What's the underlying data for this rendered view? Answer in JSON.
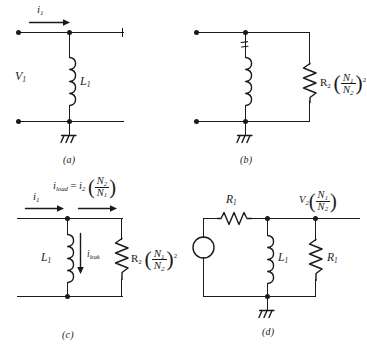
{
  "figure": {
    "type": "circuit-diagram-figure",
    "background": "#ffffff",
    "ink_color": "#1a1a1a",
    "panel_count": 4
  },
  "panels": [
    {
      "id": "a",
      "caption": "(a)",
      "labels": {
        "current_in": "i",
        "current_in_sub": "1",
        "voltage": "V",
        "voltage_sub": "1",
        "inductor": "L",
        "inductor_sub": "1"
      },
      "components": [
        "terminal-left-top",
        "terminal-left-bottom",
        "open-terminal-right",
        "inductor-L1",
        "ground"
      ]
    },
    {
      "id": "b",
      "caption": "(b)",
      "labels": {
        "resistor": "R",
        "resistor_sub": "2",
        "ratio_num": "N",
        "ratio_num_sub": "1",
        "ratio_den": "N",
        "ratio_den_sub": "2",
        "exponent": "2"
      },
      "components": [
        "terminal-left-top",
        "terminal-left-bottom",
        "inductor-L1",
        "resistor-R2-reflected",
        "ground"
      ]
    },
    {
      "id": "c",
      "caption": "(c)",
      "labels": {
        "current_in": "i",
        "current_in_sub": "1",
        "load_current": "i",
        "load_current_sub": "load",
        "equals": "=",
        "source_current": "i",
        "source_current_sub": "2",
        "turns_num": "N",
        "turns_num_sub": "2",
        "turns_den": "N",
        "turns_den_sub": "1",
        "leak_current": "i",
        "leak_current_sub": "leak",
        "inductor": "L",
        "inductor_sub": "1",
        "resistor": "R",
        "resistor_sub": "2",
        "ratio_num": "N",
        "ratio_num_sub": "1",
        "ratio_den": "N",
        "ratio_den_sub": "2",
        "exponent": "2"
      },
      "components": [
        "inductor-L1",
        "resistor-R2-reflected",
        "current-arrow-i1",
        "current-arrow-iload",
        "current-arrow-ileak"
      ]
    },
    {
      "id": "d",
      "caption": "(d)",
      "labels": {
        "series_resistor": "R",
        "series_resistor_sub": "1",
        "output_voltage": "V",
        "output_voltage_sub": "2",
        "ratio_num": "N",
        "ratio_num_sub": "1",
        "ratio_den": "N",
        "ratio_den_sub": "2",
        "inductor": "L",
        "inductor_sub": "1",
        "shunt_resistor": "R",
        "shunt_resistor_sub": "1"
      },
      "components": [
        "voltage-source",
        "resistor-R1-series",
        "inductor-L1",
        "resistor-R1-shunt",
        "ground"
      ]
    }
  ]
}
